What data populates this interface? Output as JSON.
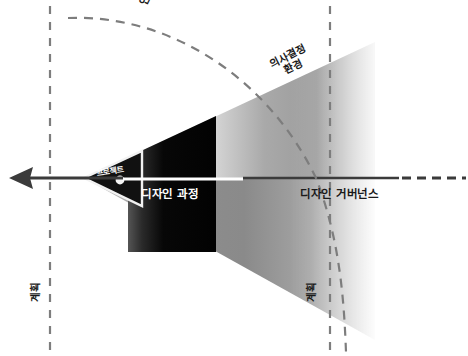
{
  "diagram": {
    "canvas": {
      "width": 468,
      "height": 356,
      "background": "#ffffff"
    },
    "labels": {
      "research": "연구",
      "decision_environment_line1": "의사결정",
      "decision_environment_line2": "환경",
      "place": "장소",
      "project": "프로젝트",
      "design_process": "디자인 과정",
      "design_governance": "디자인 거버넌스",
      "plan_left": "계획",
      "plan_right": "계획"
    },
    "colors": {
      "stroke_dark": "#3b3b3b",
      "dashed_line": "#7d7d7d",
      "cone_light": "#ffffff",
      "cone_mid": "#9a9a9a",
      "cone_dark": "#6f6f6f",
      "inner_black": "#080808",
      "apex_dot": "#f2f2f2",
      "text_dark": "#1a1a1a",
      "text_light": "#ffffff"
    },
    "geometry": {
      "apex_x": 84,
      "apex_y": 178,
      "axis_y": 178,
      "arrow_tip_x": 10,
      "dashed_vertical_left_x": 50,
      "dashed_vertical_right_x": 330,
      "cone_top_right_y": 42,
      "cone_bottom_right_y": 340,
      "cone_right_x": 360
    }
  }
}
